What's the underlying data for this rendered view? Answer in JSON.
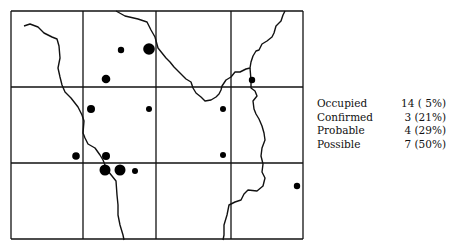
{
  "map": {
    "grid": {
      "x_lines": [
        11,
        83,
        156,
        231,
        303
      ],
      "y_lines": [
        11,
        87,
        163,
        239
      ],
      "stroke": "#111111"
    },
    "rivers": [
      "M24,26 L30,24 L38,27 L44,33 L52,37 L57,39 L59,46 L60,58 L58,68 L60,77 L62,85 L65,92 L71,98 L78,107 L82,115 L84,121 L83,133 L85,138 L88,144 L95,148 L100,155 L103,160 L105,165 L108,171 L112,176 L116,181 L117,195 L118,205 L118,215 L120,225 L123,235 L124,240",
      "M116,11 L125,16 L138,19 L147,22 L151,30 L155,37 L158,48 L162,53 L166,58 L170,62 L174,67 L180,73 L186,79 L191,82 L193,88 L196,93 L201,97 L205,101 L211,100 L216,97 L219,94 L221,90 L222,86 L226,80 L231,77 L235,72 L240,72 L246,69 L250,68 L251,62 L253,56 L256,51 L259,50 L262,44 L267,41 L272,37 L274,33 L276,26 L281,21 L283,15 L285,11",
      "M250,68 L251,80 L251,88 L255,91 L257,96 L253,101 L254,109 L256,114 L259,119 L262,126 L264,133 L265,140 L262,148 L261,156 L263,164 L262,172 L265,178 L263,186 L257,191 L248,190 L244,194 L241,200 L235,202 L229,205 L227,215 L224,225 L224,235 L223,240"
    ],
    "dots": [
      {
        "x": 121,
        "y": 50,
        "r": 3.2,
        "status": "possible"
      },
      {
        "x": 149,
        "y": 49,
        "r": 5.8,
        "status": "occupied"
      },
      {
        "x": 106,
        "y": 79,
        "r": 4.3,
        "status": "probable"
      },
      {
        "x": 91,
        "y": 109,
        "r": 4.0,
        "status": "probable"
      },
      {
        "x": 149,
        "y": 109,
        "r": 3.0,
        "status": "possible"
      },
      {
        "x": 223,
        "y": 109,
        "r": 3.0,
        "status": "possible"
      },
      {
        "x": 252,
        "y": 80,
        "r": 3.2,
        "status": "possible"
      },
      {
        "x": 76,
        "y": 156,
        "r": 3.8,
        "status": "probable"
      },
      {
        "x": 106,
        "y": 156,
        "r": 4.0,
        "status": "probable"
      },
      {
        "x": 223,
        "y": 155,
        "r": 3.0,
        "status": "possible"
      },
      {
        "x": 105,
        "y": 170,
        "r": 5.5,
        "status": "confirmed"
      },
      {
        "x": 120,
        "y": 170,
        "r": 5.5,
        "status": "confirmed"
      },
      {
        "x": 135,
        "y": 171,
        "r": 3.0,
        "status": "possible"
      },
      {
        "x": 297,
        "y": 186,
        "r": 3.2,
        "status": "possible"
      }
    ]
  },
  "legend": [
    {
      "label": "Occupied",
      "value": "14 ( 5%)"
    },
    {
      "label": "Confirmed",
      "value": "3 (21%)"
    },
    {
      "label": "Probable",
      "value": "4 (29%)"
    },
    {
      "label": "Possible",
      "value": "7 (50%)"
    }
  ]
}
